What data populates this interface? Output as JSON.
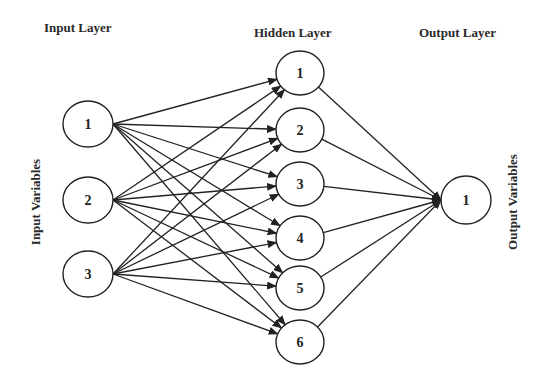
{
  "layers": {
    "input": {
      "title": "Input Layer",
      "side_label": "Input Variables",
      "nodes": [
        {
          "label": "1",
          "cx": 88,
          "cy": 124
        },
        {
          "label": "2",
          "cx": 88,
          "cy": 200
        },
        {
          "label": "3",
          "cx": 88,
          "cy": 274
        }
      ]
    },
    "hidden": {
      "title": "Hidden Layer",
      "nodes": [
        {
          "label": "1",
          "cx": 300,
          "cy": 73
        },
        {
          "label": "2",
          "cx": 300,
          "cy": 130
        },
        {
          "label": "3",
          "cx": 300,
          "cy": 184
        },
        {
          "label": "4",
          "cx": 300,
          "cy": 238
        },
        {
          "label": "5",
          "cx": 300,
          "cy": 288
        },
        {
          "label": "6",
          "cx": 300,
          "cy": 342
        }
      ]
    },
    "output": {
      "title": "Output Layer",
      "side_label": "Output Variables",
      "nodes": [
        {
          "label": "1",
          "cx": 466,
          "cy": 200
        }
      ]
    }
  },
  "style": {
    "stroke_color": "#222222",
    "background": "#ffffff"
  }
}
